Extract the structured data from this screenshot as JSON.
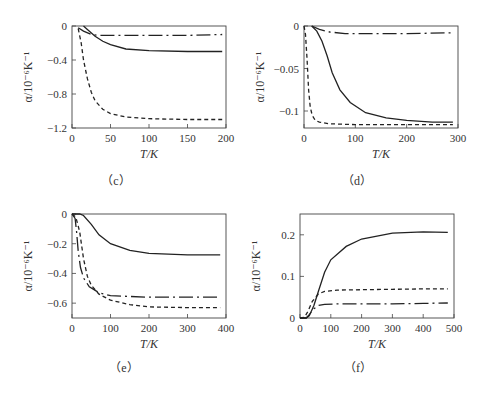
{
  "chart_data": [
    {
      "panel": "(c)",
      "type": "line",
      "xlabel": "T/K",
      "ylabel": "α/10⁻⁶K⁻¹",
      "xlim": [
        0,
        200
      ],
      "ylim": [
        -1.2,
        0
      ],
      "xticks": [
        0,
        50,
        100,
        150,
        200
      ],
      "yticks": [
        0,
        -0.4,
        -0.8,
        -1.2
      ],
      "ytick_labels": [
        "0",
        "−0.4",
        "−0.8",
        "−1.2"
      ],
      "series": [
        {
          "name": "solid",
          "style": "solid",
          "x": [
            15,
            20,
            30,
            40,
            50,
            70,
            100,
            150,
            195
          ],
          "y": [
            0,
            -0.04,
            -0.12,
            -0.18,
            -0.22,
            -0.27,
            -0.29,
            -0.3,
            -0.3
          ]
        },
        {
          "name": "dashed",
          "style": "dashed",
          "x": [
            8,
            12,
            15,
            20,
            25,
            30,
            40,
            50,
            70,
            100,
            150,
            195
          ],
          "y": [
            -0.03,
            -0.2,
            -0.4,
            -0.62,
            -0.78,
            -0.88,
            -0.98,
            -1.03,
            -1.07,
            -1.09,
            -1.1,
            -1.1
          ]
        },
        {
          "name": "dash-dot",
          "style": "dashdot",
          "x": [
            8,
            15,
            25,
            35,
            50,
            100,
            150,
            195
          ],
          "y": [
            -0.02,
            -0.06,
            -0.1,
            -0.11,
            -0.11,
            -0.11,
            -0.11,
            -0.1
          ]
        }
      ]
    },
    {
      "panel": "(d)",
      "type": "line",
      "xlabel": "T/K",
      "ylabel": "α/10⁻⁶K⁻¹",
      "xlim": [
        0,
        300
      ],
      "ylim": [
        -0.12,
        0
      ],
      "xticks": [
        0,
        100,
        200,
        300
      ],
      "yticks": [
        0,
        -0.05,
        -0.1
      ],
      "ytick_labels": [
        "0",
        "−0.05",
        "−0.1"
      ],
      "series": [
        {
          "name": "solid",
          "style": "solid",
          "x": [
            15,
            25,
            35,
            45,
            55,
            70,
            90,
            120,
            160,
            200,
            250,
            290
          ],
          "y": [
            0,
            -0.006,
            -0.018,
            -0.035,
            -0.055,
            -0.075,
            -0.09,
            -0.102,
            -0.108,
            -0.111,
            -0.113,
            -0.113
          ]
        },
        {
          "name": "dashed",
          "style": "dashed",
          "x": [
            0,
            3,
            6,
            9,
            12,
            16,
            22,
            30,
            50,
            100,
            200,
            290
          ],
          "y": [
            0,
            -0.01,
            -0.04,
            -0.075,
            -0.095,
            -0.105,
            -0.111,
            -0.113,
            -0.115,
            -0.116,
            -0.116,
            -0.116
          ]
        },
        {
          "name": "dash-dot",
          "style": "dashdot",
          "x": [
            15,
            30,
            50,
            80,
            120,
            200,
            290
          ],
          "y": [
            0,
            -0.004,
            -0.007,
            -0.009,
            -0.009,
            -0.009,
            -0.008
          ]
        }
      ]
    },
    {
      "panel": "(e)",
      "type": "line",
      "xlabel": "T/K",
      "ylabel": "α/10⁻⁶K⁻¹",
      "xlim": [
        0,
        400
      ],
      "ylim": [
        -0.7,
        0
      ],
      "xticks": [
        0,
        100,
        200,
        300,
        400
      ],
      "yticks": [
        0,
        -0.2,
        -0.4,
        -0.6
      ],
      "ytick_labels": [
        "0",
        "−0.2",
        "−0.4",
        "−0.6"
      ],
      "series": [
        {
          "name": "solid",
          "style": "solid",
          "x": [
            0,
            20,
            30,
            50,
            70,
            100,
            150,
            200,
            300,
            385
          ],
          "y": [
            0,
            0,
            -0.01,
            -0.07,
            -0.14,
            -0.2,
            -0.245,
            -0.265,
            -0.275,
            -0.275
          ]
        },
        {
          "name": "dashed",
          "style": "dashed",
          "x": [
            0,
            10,
            20,
            30,
            40,
            50,
            70,
            100,
            150,
            200,
            300,
            385
          ],
          "y": [
            0,
            -0.02,
            -0.12,
            -0.3,
            -0.42,
            -0.48,
            -0.54,
            -0.58,
            -0.61,
            -0.625,
            -0.63,
            -0.63
          ]
        },
        {
          "name": "dash-dot",
          "style": "dashdot",
          "x": [
            0,
            8,
            12,
            16,
            22,
            30,
            45,
            70,
            100,
            200,
            300,
            385
          ],
          "y": [
            0,
            -0.03,
            -0.12,
            -0.25,
            -0.36,
            -0.43,
            -0.49,
            -0.53,
            -0.55,
            -0.56,
            -0.56,
            -0.56
          ]
        }
      ]
    },
    {
      "panel": "(f)",
      "type": "line",
      "xlabel": "T/K",
      "ylabel": "α/10⁻⁶K⁻¹",
      "xlim": [
        0,
        500
      ],
      "ylim": [
        0,
        0.25
      ],
      "xticks": [
        0,
        100,
        200,
        300,
        400,
        500
      ],
      "yticks": [
        0,
        0.1,
        0.2
      ],
      "ytick_labels": [
        "0",
        "0.1",
        "0.2"
      ],
      "series": [
        {
          "name": "solid",
          "style": "solid",
          "x": [
            0,
            20,
            30,
            45,
            60,
            80,
            100,
            150,
            200,
            300,
            400,
            480
          ],
          "y": [
            0,
            0,
            0.005,
            0.03,
            0.065,
            0.11,
            0.14,
            0.172,
            0.19,
            0.204,
            0.207,
            0.206
          ]
        },
        {
          "name": "dashed",
          "style": "dashed",
          "x": [
            0,
            15,
            25,
            40,
            60,
            80,
            120,
            200,
            300,
            400,
            480
          ],
          "y": [
            0,
            0.002,
            0.015,
            0.04,
            0.058,
            0.064,
            0.067,
            0.068,
            0.069,
            0.07,
            0.07
          ]
        },
        {
          "name": "dash-dot",
          "style": "dashdot",
          "x": [
            0,
            20,
            30,
            45,
            60,
            80,
            120,
            200,
            300,
            400,
            480
          ],
          "y": [
            0,
            0,
            0.008,
            0.022,
            0.03,
            0.033,
            0.034,
            0.034,
            0.034,
            0.035,
            0.036
          ]
        }
      ]
    }
  ],
  "panels": {
    "c": {
      "label": "（c）",
      "xlabel": "T/K",
      "ylabel": "α/10⁻⁶K⁻¹"
    },
    "d": {
      "label": "（d）",
      "xlabel": "T/K",
      "ylabel": "α/10⁻⁶K⁻¹"
    },
    "e": {
      "label": "（e）",
      "xlabel": "T/K",
      "ylabel": "α/10⁻⁶K⁻¹"
    },
    "f": {
      "label": "（f）",
      "xlabel": "T/K",
      "ylabel": "α/10⁻⁶K⁻¹"
    }
  }
}
